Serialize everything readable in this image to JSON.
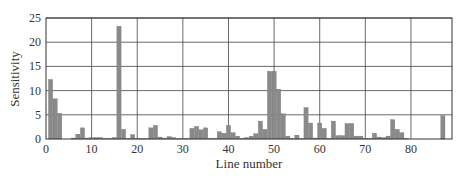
{
  "chart_data": {
    "type": "bar",
    "title": "",
    "xlabel": "Line number",
    "ylabel": "Sensitivity",
    "xlim": [
      0,
      89
    ],
    "ylim": [
      0,
      25
    ],
    "xticks": [
      0,
      10,
      20,
      30,
      40,
      50,
      60,
      70,
      80
    ],
    "yticks": [
      0,
      5,
      10,
      15,
      20,
      25
    ],
    "grid": true,
    "legend": null,
    "bar_color": "#8a8a8a",
    "x": [
      1,
      2,
      3,
      4,
      5,
      6,
      7,
      8,
      9,
      10,
      11,
      12,
      13,
      14,
      15,
      16,
      17,
      18,
      19,
      20,
      21,
      22,
      23,
      24,
      25,
      26,
      27,
      28,
      29,
      30,
      31,
      32,
      33,
      34,
      35,
      36,
      37,
      38,
      39,
      40,
      41,
      42,
      43,
      44,
      45,
      46,
      47,
      48,
      49,
      50,
      51,
      52,
      53,
      54,
      55,
      56,
      57,
      58,
      59,
      60,
      61,
      62,
      63,
      64,
      65,
      66,
      67,
      68,
      69,
      70,
      71,
      72,
      73,
      74,
      75,
      76,
      77,
      78,
      79,
      80,
      81,
      82,
      83,
      84,
      85,
      86,
      87
    ],
    "values": [
      12.3,
      8.3,
      5.3,
      0,
      0,
      0.2,
      1.0,
      2.3,
      0.2,
      0.3,
      0.3,
      0.3,
      0.1,
      0.1,
      0.3,
      23.3,
      2.0,
      0.1,
      0.9,
      0.1,
      0.1,
      0.1,
      2.3,
      2.8,
      0.4,
      0.2,
      0.5,
      0.3,
      0.1,
      0.1,
      0.1,
      2.2,
      2.6,
      1.9,
      2.3,
      0.1,
      0.1,
      1.5,
      1.2,
      2.8,
      1.3,
      0.6,
      0.1,
      0.3,
      0.6,
      1.1,
      3.7,
      2.0,
      14.0,
      14.0,
      10.3,
      5.2,
      0.6,
      0.1,
      0.8,
      0.1,
      6.5,
      3.3,
      0.2,
      3.3,
      2.2,
      0.1,
      3.7,
      0.7,
      0.7,
      3.2,
      3.2,
      0.6,
      0.6,
      0.1,
      0.1,
      1.2,
      0.4,
      0.3,
      0.6,
      4.0,
      2.0,
      1.3,
      0.1,
      0,
      0,
      0,
      0,
      0,
      0,
      0,
      4.8
    ]
  }
}
